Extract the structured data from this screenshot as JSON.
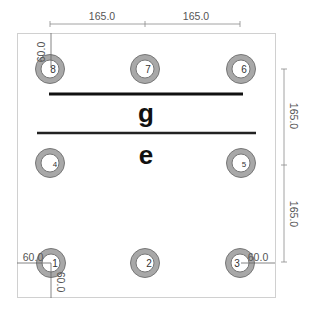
{
  "diagram": {
    "type": "pin-layout",
    "colors": {
      "ring": "#a6a6a6",
      "ring_stroke": "#6e6e6e",
      "border": "#cccccc",
      "dim_line": "#888888",
      "bar": "#111111"
    },
    "labels": {
      "top_region": "g",
      "bottom_region": "e"
    },
    "pins": [
      {
        "id": "1",
        "label": "1",
        "x": 50,
        "y": 263
      },
      {
        "id": "2",
        "label": "2",
        "x": 145,
        "y": 263
      },
      {
        "id": "3",
        "label": "3",
        "x": 241,
        "y": 263
      },
      {
        "id": "4",
        "label": "4",
        "x": 50,
        "y": 163
      },
      {
        "id": "5",
        "label": "5",
        "x": 241,
        "y": 163
      },
      {
        "id": "6",
        "label": "6",
        "x": 50,
        "y": 69
      },
      {
        "id": "7",
        "label": "7",
        "x": 145,
        "y": 69
      },
      {
        "id": "8",
        "label": "8",
        "x": 241,
        "y": 69
      }
    ],
    "dimensions": {
      "top_left_span": "165.0",
      "top_right_span": "165.0",
      "right_upper_span": "165.0",
      "right_lower_span": "165.0",
      "pin6_top_offset": "60.0",
      "pin1_left_offset": "60.0",
      "pin1_bottom_offset": "60.0",
      "pin3_right_offset": "60.0"
    }
  }
}
